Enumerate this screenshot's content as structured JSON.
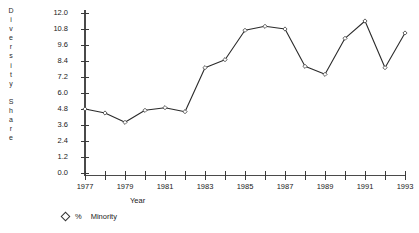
{
  "chart_data": {
    "type": "line",
    "title": "",
    "xlabel": "Year",
    "ylabel": "Diversity Share",
    "ylabel_letters": [
      "D",
      "i",
      "v",
      "e",
      "r",
      "s",
      "i",
      "t",
      "y",
      "",
      "S",
      "h",
      "a",
      "r",
      "e"
    ],
    "x": [
      1977,
      1978,
      1979,
      1980,
      1981,
      1982,
      1983,
      1984,
      1985,
      1986,
      1987,
      1988,
      1989,
      1990,
      1991,
      1992,
      1993
    ],
    "values": [
      4.8,
      4.5,
      3.8,
      4.7,
      4.9,
      4.6,
      7.9,
      8.5,
      10.7,
      11.0,
      10.8,
      8.0,
      7.4,
      10.1,
      11.4,
      7.9,
      10.5
    ],
    "series": [
      {
        "name": "% Minority",
        "values": [
          4.8,
          4.5,
          3.8,
          4.7,
          4.9,
          4.6,
          7.9,
          8.5,
          10.7,
          11.0,
          10.8,
          8.0,
          7.4,
          10.1,
          11.4,
          7.9,
          10.5
        ]
      }
    ],
    "ylim": [
      0.0,
      12.0
    ],
    "xlim": [
      1977,
      1993
    ],
    "ytick_labels": [
      "12.0",
      "10.8",
      "9.6",
      "8.4",
      "7.2",
      "6.0",
      "4.8",
      "3.6",
      "2.4",
      "1.2",
      "0.0"
    ],
    "ytick_values": [
      12.0,
      10.8,
      9.6,
      8.4,
      7.2,
      6.0,
      4.8,
      3.6,
      2.4,
      1.2,
      0.0
    ],
    "xtick_values": [
      1977,
      1978,
      1979,
      1980,
      1981,
      1982,
      1983,
      1984,
      1985,
      1986,
      1987,
      1988,
      1989,
      1990,
      1991,
      1992,
      1993
    ],
    "xtick_labels": [
      "1977",
      "",
      "1979",
      "",
      "1981",
      "",
      "1983",
      "",
      "1985",
      "",
      "1987",
      "",
      "1989",
      "",
      "1991",
      "",
      "1993"
    ],
    "grid": false,
    "legend": [
      {
        "marker": "diamond-marker",
        "symbol": "%",
        "label": "Minority"
      }
    ],
    "legend_position": "bottom-left",
    "marker_style": "open-diamond",
    "line_color": "#2b2b2b",
    "marker_color": "#ffffff",
    "axis_color": "#4a4a4a"
  }
}
